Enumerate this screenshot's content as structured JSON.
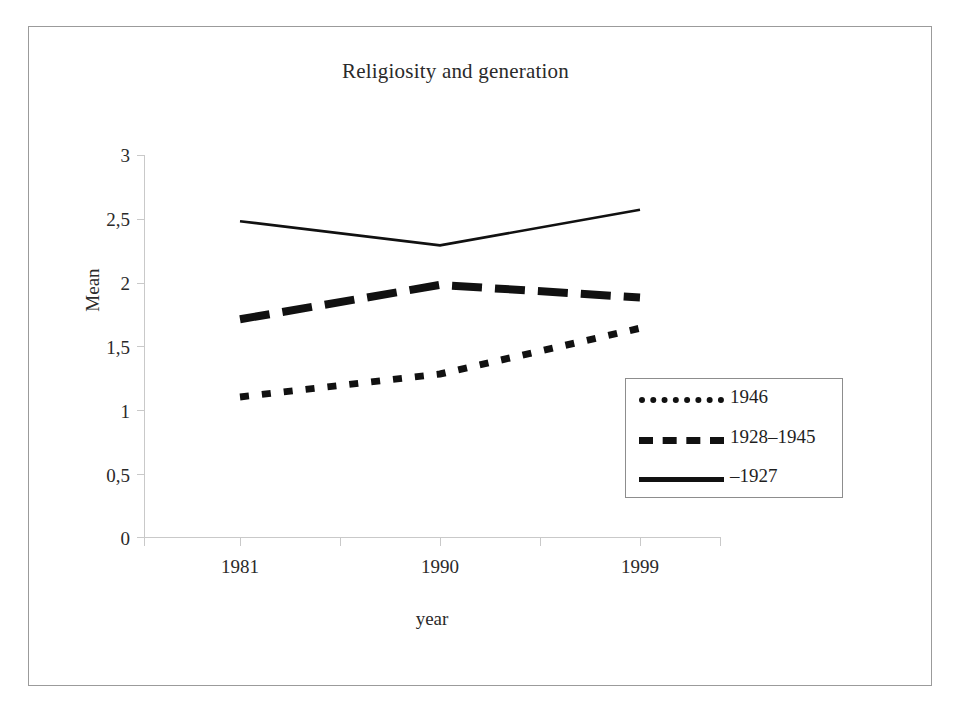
{
  "chart_data": {
    "type": "line",
    "title": "Religiosity and generation",
    "xlabel": "year",
    "ylabel": "Mean",
    "categories": [
      "1981",
      "1990",
      "1999"
    ],
    "x": [
      1981,
      1990,
      1999
    ],
    "ylim": [
      0,
      3
    ],
    "ytick_labels": [
      "3",
      "2,5",
      "2",
      "1,5",
      "1",
      "0,5",
      "0"
    ],
    "ytick_values": [
      3,
      2.5,
      2,
      1.5,
      1,
      0.5,
      0
    ],
    "grid": false,
    "legend_position": "center-right",
    "series": [
      {
        "name": "1946",
        "style": "dotted",
        "color": "#111111",
        "values": [
          1.1,
          1.28,
          1.64
        ]
      },
      {
        "name": "1928–1945",
        "style": "dashed",
        "color": "#111111",
        "values": [
          1.71,
          1.98,
          1.88
        ]
      },
      {
        "name": "–1927",
        "style": "solid",
        "color": "#111111",
        "values": [
          2.48,
          2.29,
          2.57
        ]
      }
    ]
  },
  "chart": {
    "title": "Religiosity and generation",
    "y_axis_title": "Mean",
    "x_axis_title": "year",
    "y_ticks": [
      "3",
      "2,5",
      "2",
      "1,5",
      "1",
      "0,5",
      "0"
    ],
    "x_ticks": [
      "1981",
      "1990",
      "1999"
    ],
    "legend": [
      {
        "label": "1946",
        "style": "dotted"
      },
      {
        "label": "1928–1945",
        "style": "dashed"
      },
      {
        "label": "–1927",
        "style": "solid"
      }
    ]
  }
}
